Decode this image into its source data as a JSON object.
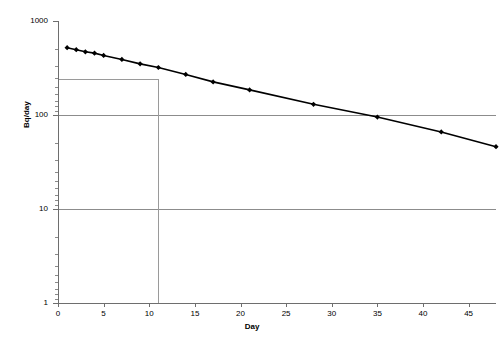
{
  "chart": {
    "type": "line",
    "background_color": "#ffffff",
    "series_color": "#000000",
    "grid_color": "#8c8c8c",
    "reference_line_color": "#9a9a9a",
    "axis_color": "#6e6e6e"
  },
  "axes": {
    "x": {
      "title": "Day",
      "min": 0,
      "max": 48,
      "scale": "linear",
      "tick_labels": [
        "0",
        "5",
        "10",
        "15",
        "20",
        "25",
        "30",
        "35",
        "40",
        "45"
      ],
      "tick_values": [
        0,
        5,
        10,
        15,
        20,
        25,
        30,
        35,
        40,
        45
      ]
    },
    "y": {
      "title": "Bq/day",
      "min": 1,
      "max": 1000,
      "scale": "log",
      "tick_labels": [
        "1000",
        "100",
        "10",
        "1"
      ],
      "tick_values": [
        1000,
        100,
        10,
        1
      ]
    }
  },
  "reference_lines": {
    "vertical_day": 11,
    "horizontal_value": 250
  },
  "chart_data": {
    "type": "line",
    "title": "",
    "subtitle": "",
    "xlabel": "Day",
    "ylabel": "Bq/day",
    "xlim": [
      0,
      48
    ],
    "ylim": [
      1,
      1000
    ],
    "yscale": "log",
    "xscale": "linear",
    "grid": true,
    "legend": false,
    "markers": "filled-diamond",
    "x": [
      1,
      2,
      3,
      4,
      5,
      7,
      9,
      11,
      14,
      17,
      21,
      28,
      35,
      42,
      48
    ],
    "values": [
      520,
      495,
      470,
      455,
      430,
      390,
      350,
      320,
      270,
      225,
      185,
      130,
      95,
      66,
      46
    ],
    "series": [
      {
        "name": "Bq/day",
        "x": [
          1,
          2,
          3,
          4,
          5,
          7,
          9,
          11,
          14,
          17,
          21,
          28,
          35,
          42,
          48
        ],
        "values": [
          520,
          495,
          470,
          455,
          430,
          390,
          350,
          320,
          270,
          225,
          185,
          130,
          95,
          66,
          46
        ]
      }
    ],
    "annotations": [
      {
        "type": "vline",
        "x": 11,
        "label": ""
      },
      {
        "type": "hline",
        "y": 250,
        "label": ""
      }
    ]
  }
}
